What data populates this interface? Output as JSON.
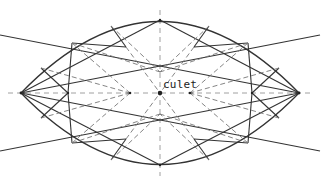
{
  "diagram": {
    "labels": {
      "culet": "culet"
    },
    "colors": {
      "solid_line": "#333333",
      "dashed_line": "#777777",
      "background": "#ffffff"
    }
  }
}
